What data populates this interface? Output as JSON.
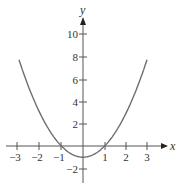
{
  "chart_data": {
    "type": "line",
    "title": "",
    "function": "y = x^2 - 1",
    "xlabel": "x",
    "ylabel": "y",
    "xlim": [
      -3,
      3
    ],
    "ylim": [
      -2,
      10
    ],
    "x_ticks": [
      "-3",
      "-2",
      "-1",
      "1",
      "2",
      "3"
    ],
    "y_ticks": [
      "10",
      "8",
      "6",
      "4",
      "2",
      "-2"
    ],
    "grid": false,
    "series": [
      {
        "name": "parabola",
        "x": [
          -3,
          -2.5,
          -2,
          -1.5,
          -1,
          -0.5,
          0,
          0.5,
          1,
          1.5,
          2,
          2.5,
          3
        ],
        "values": [
          8,
          5.25,
          3,
          1.25,
          0,
          -0.75,
          -1,
          -0.75,
          0,
          1.25,
          3,
          5.25,
          8
        ]
      }
    ],
    "colors": {
      "curve": "#6e6e6e",
      "axis": "#555555"
    }
  }
}
